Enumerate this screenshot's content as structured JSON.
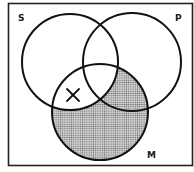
{
  "diagram": {
    "type": "venn-3",
    "frame": {
      "x": 8,
      "y": 3,
      "width": 184,
      "height": 162
    },
    "circles": [
      {
        "id": "S",
        "label": "S",
        "cx": 70,
        "cy": 62,
        "r": 48
      },
      {
        "id": "P",
        "label": "P",
        "cx": 132,
        "cy": 62,
        "r": 49
      },
      {
        "id": "M",
        "label": "M",
        "cx": 100,
        "cy": 112,
        "r": 48
      }
    ],
    "labels": {
      "S": {
        "text": "S",
        "x": 18,
        "y": 14
      },
      "P": {
        "text": "P",
        "x": 175,
        "y": 14
      },
      "M": {
        "text": "M",
        "x": 147,
        "y": 151
      }
    },
    "shaded_regions": [
      "M only (outside S and P)",
      "M and P but not S"
    ],
    "marked_regions": [
      {
        "region": "S and M but not P",
        "mark": "X",
        "x": 73,
        "y": 95
      }
    ],
    "colors": {
      "stroke": "#111111",
      "shade_dot": "#555555",
      "background": "#ffffff"
    }
  }
}
